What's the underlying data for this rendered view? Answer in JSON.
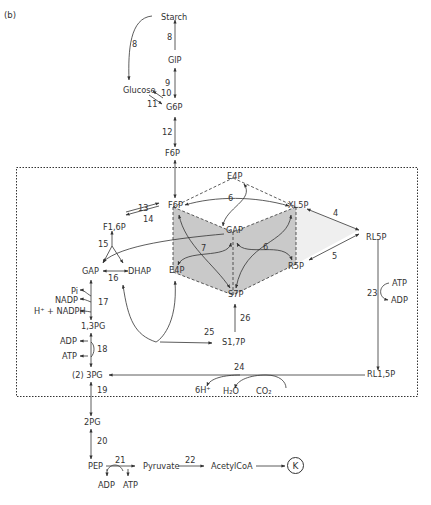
{
  "panel_label": "(b)",
  "region": {
    "name": "calvin-cycle-box",
    "style": "dotted"
  },
  "colors": {
    "line": "#333333",
    "cube_face": "#c9c9c9",
    "triangle_face": "#efefef",
    "background": "#ffffff"
  },
  "metabolites": {
    "starch": "Starch",
    "g1p": "GlP",
    "glucose": "Glucose",
    "g6p": "G6P",
    "f6p_top": "F6P",
    "e4p_top": "E4P",
    "f6p": "F6P",
    "xl5p": "XL5P",
    "gap_center": "GAP",
    "e4p_bottom": "E4P",
    "r5p": "R5P",
    "s7p": "S7P",
    "rl5p": "RL5P",
    "f16p": "F1,6P",
    "gap": "GAP",
    "dhap": "DHAP",
    "pi": "Pi",
    "nadp": "NADP",
    "nadph": "H⁺ + NADPH",
    "pg13": "1,3PG",
    "adp18": "ADP",
    "atp18": "ATP",
    "pg3": "(2) 3PG",
    "s17p": "S1,7P",
    "atp23": "ATP",
    "adp23": "ADP",
    "rl15p": "RL1,5P",
    "h6": "6H⁺",
    "h2o": "H₂O",
    "co2": "CO₂",
    "pg2": "2PG",
    "pep": "PEP",
    "adp21": "ADP",
    "atp21": "ATP",
    "pyruvate": "Pyruvate",
    "acetylcoa": "AcetylCoA",
    "k": "K"
  },
  "reactions": {
    "r8a": "8",
    "r8b": "8",
    "r9": "9",
    "r10": "10",
    "r11": "11",
    "r12": "12",
    "r13": "13",
    "r14": "14",
    "r15": "15",
    "r16": "16",
    "r17": "17",
    "r18": "18",
    "r19": "19",
    "r20": "20",
    "r21": "21",
    "r22": "22",
    "r23": "23",
    "r24": "24",
    "r25": "25",
    "r26": "26",
    "r6a": "6",
    "r6b": "6",
    "r7": "7",
    "r4": "4",
    "r5": "5"
  }
}
